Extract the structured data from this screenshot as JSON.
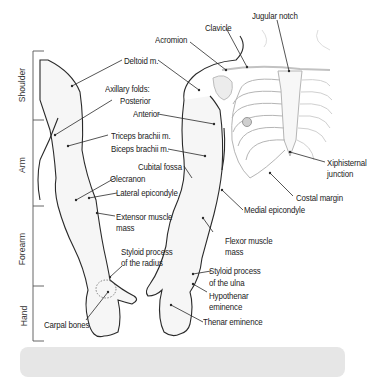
{
  "figure": {
    "type": "anatomical-diagram",
    "regions": [
      {
        "id": "shoulder",
        "label": "Shoulder"
      },
      {
        "id": "arm",
        "label": "Arm"
      },
      {
        "id": "forearm",
        "label": "Forearm"
      },
      {
        "id": "hand",
        "label": "Hand"
      }
    ],
    "labels": {
      "jugular_notch": "Jugular notch",
      "clavicle": "Clavicle",
      "acromion": "Acromion",
      "deltoid": "Deltoid m.",
      "axillary_folds": "Axillary folds:",
      "posterior": "Posterior",
      "anterior": "Anterior",
      "triceps": "Triceps brachii m.",
      "biceps": "Biceps brachii m.",
      "cubital_fossa": "Cubital fossa",
      "olecranon": "Olecranon",
      "lateral_epicondyle": "Lateral epicondyle",
      "extensor_line1": "Extensor muscle",
      "extensor_line2": "mass",
      "xiphisternal_line1": "Xiphisternal",
      "xiphisternal_line2": "junction",
      "costal_margin": "Costal margin",
      "medial_epicondyle": "Medial epicondyle",
      "flexor_line1": "Flexor muscle",
      "flexor_line2": "mass",
      "styloid_radius_line1": "Styloid process",
      "styloid_radius_line2": "of the radius",
      "styloid_ulna_line1": "Styloid process",
      "styloid_ulna_line2": "of the ulna",
      "hypothenar_line1": "Hypothenar",
      "hypothenar_line2": "eminence",
      "thenar": "Thenar eminence",
      "carpal_bones": "Carpal bones"
    },
    "colors": {
      "outline": "#2a2a2a",
      "skeleton": "#b8b8b8",
      "skin_fill": "#f4f4f4",
      "caption_box": "#e6e6e6"
    }
  }
}
